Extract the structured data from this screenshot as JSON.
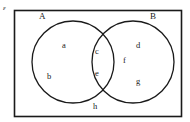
{
  "diagram": {
    "type": "venn",
    "title": "",
    "universe": {
      "symbol": "ε",
      "name": "universal-set",
      "shape": "rectangle"
    },
    "sets": [
      {
        "id": "A",
        "label": "A",
        "side": "left"
      },
      {
        "id": "B",
        "label": "B",
        "side": "right"
      }
    ],
    "regions": [
      {
        "id": "a",
        "label": "a",
        "belongs": "A only"
      },
      {
        "id": "b",
        "label": "b",
        "belongs": "A only"
      },
      {
        "id": "c",
        "label": "c",
        "belongs": "A and B"
      },
      {
        "id": "e",
        "label": "e",
        "belongs": "A and B"
      },
      {
        "id": "d",
        "label": "d",
        "belongs": "B only"
      },
      {
        "id": "f",
        "label": "f",
        "belongs": "B only"
      },
      {
        "id": "g",
        "label": "g",
        "belongs": "B only"
      },
      {
        "id": "h",
        "label": "h",
        "belongs": "outside A and B"
      }
    ],
    "colors": {
      "stroke": "#1a1a1a",
      "fill": "#ffffff",
      "text": "#1a1a1a",
      "background": "#ffffff"
    }
  }
}
